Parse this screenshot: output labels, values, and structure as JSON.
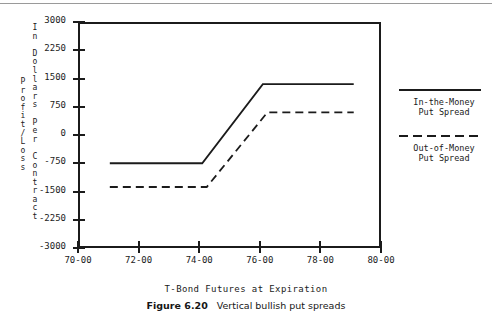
{
  "figure": {
    "caption_label": "Figure 6.20",
    "caption_text": "Vertical bullish put spreads"
  },
  "axis_titles": {
    "y_outer": "Profit/Loss",
    "y_inner": "In Dollars Per Contract",
    "x": "T-Bond Futures at Expiration"
  },
  "legend": {
    "entries": [
      {
        "label": "In-the-Money\nPut Spread",
        "style": "solid",
        "color": "#1b1b1b"
      },
      {
        "label": "Out-of-Money\nPut Spread",
        "style": "dashed",
        "color": "#1b1b1b"
      }
    ]
  },
  "chart_data": {
    "type": "line",
    "title": "",
    "xlabel": "T-Bond Futures at Expiration",
    "ylabel": "Profit/Loss In Dollars Per Contract",
    "xlim": [
      70,
      80
    ],
    "ylim": [
      -3000,
      3000
    ],
    "grid": false,
    "legend_position": "right",
    "xtick_labels": [
      "70-00",
      "72-00",
      "74-00",
      "76-00",
      "78-00",
      "80-00"
    ],
    "xtick_values": [
      70,
      72,
      74,
      76,
      78,
      80
    ],
    "ytick_labels": [
      "3000",
      "2250",
      "1500",
      "750",
      "0",
      "-750",
      "-1500",
      "-2250",
      "-3000"
    ],
    "ytick_values": [
      3000,
      2250,
      1500,
      750,
      0,
      -750,
      -1500,
      -2250,
      -3000
    ],
    "series": [
      {
        "name": "In-the-Money Put Spread",
        "style": "solid",
        "color": "#1b1b1b",
        "x": [
          71.05,
          74.1,
          76.1,
          79.1
        ],
        "y": [
          -750,
          -750,
          1350,
          1350
        ]
      },
      {
        "name": "Out-of-Money Put Spread",
        "style": "dashed",
        "color": "#1b1b1b",
        "x": [
          71.05,
          74.25,
          76.25,
          79.1
        ],
        "y": [
          -1380,
          -1380,
          600,
          600
        ]
      }
    ]
  }
}
